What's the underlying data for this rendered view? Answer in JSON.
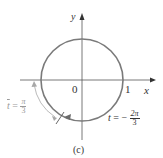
{
  "figure": {
    "caption": "(c)",
    "axes": {
      "x_label": "x",
      "y_label": "y",
      "origin_label": "0",
      "x_tick_label": "1"
    },
    "annotations": {
      "start": {
        "var": "t",
        "eq": "= −",
        "num": "2π",
        "den": "3"
      },
      "end": {
        "var": "t",
        "eq": "=",
        "num": "π",
        "den": "3"
      }
    },
    "colors": {
      "circle": "#7a7a7a",
      "axes": "#555555",
      "arrow_gray": "#a8a8a8",
      "text": "#333333"
    }
  }
}
